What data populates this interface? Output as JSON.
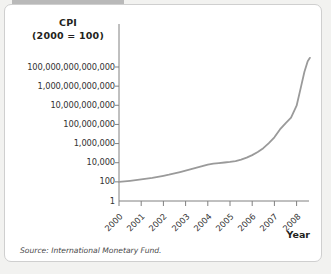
{
  "figure": {
    "background_color": "#f2f2f0",
    "panel_color": "#ffffff",
    "panel_border_color": "#cfcfcf",
    "top_bar_color": "#b9b9b9",
    "source_label": "Source:",
    "source_text": "International Monetary Fund.",
    "source_full": "Source: International Monetary Fund."
  },
  "chart_data": {
    "type": "line",
    "title": "CPI\n(2000 = 100)",
    "title_line1": "CPI",
    "title_line2": "(2000 = 100)",
    "xlabel": "Year",
    "ylabel": "CPI (2000 = 100)",
    "yscale": "log",
    "grid": false,
    "legend": "none",
    "line_color": "#9a9a9a",
    "line_width": 1.8,
    "ylim": [
      1,
      1000000000000000
    ],
    "xlim": [
      2000,
      2008.75
    ],
    "ytick_values": [
      1,
      100,
      10000,
      1000000,
      100000000,
      10000000000,
      1000000000000,
      100000000000000
    ],
    "ytick_labels": [
      "1",
      "100",
      "10,000",
      "1,000,000",
      "100,000,000",
      "10,000,000,000",
      "1,000,000,000,000",
      "100,000,000,000,000"
    ],
    "xtick_values": [
      2000,
      2001,
      2002,
      2003,
      2004,
      2005,
      2006,
      2007,
      2008
    ],
    "xtick_labels": [
      "2000",
      "2001",
      "2002",
      "2003",
      "2004",
      "2005",
      "2006",
      "2007",
      "2008"
    ],
    "series": [
      {
        "name": "CPI",
        "x": [
          2000.0,
          2000.25,
          2000.5,
          2000.75,
          2001.0,
          2001.25,
          2001.5,
          2001.75,
          2002.0,
          2002.25,
          2002.5,
          2002.75,
          2003.0,
          2003.25,
          2003.5,
          2003.75,
          2004.0,
          2004.25,
          2004.5,
          2004.75,
          2005.0,
          2005.25,
          2005.5,
          2005.75,
          2006.0,
          2006.25,
          2006.5,
          2006.75,
          2007.0,
          2007.25,
          2007.5,
          2007.75,
          2008.0,
          2008.2,
          2008.35,
          2008.5,
          2008.6
        ],
        "y": [
          100,
          112,
          128,
          150,
          180,
          215,
          260,
          330,
          430,
          560,
          760,
          1050,
          1500,
          2100,
          3000,
          4300,
          6300,
          8000,
          9200,
          10500,
          12000,
          15000,
          21000,
          34000,
          62000,
          130000,
          330000,
          1100000,
          4500000,
          30000000,
          130000000,
          500000000,
          9000000000,
          900000000000,
          30000000000000,
          400000000000000,
          900000000000000
        ]
      }
    ]
  }
}
